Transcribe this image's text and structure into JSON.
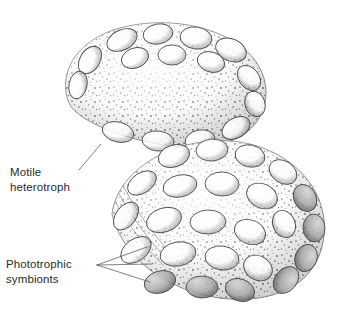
{
  "figure": {
    "background_color": "#ffffff",
    "width": 340,
    "height": 319
  },
  "labels": [
    {
      "id": "motile-heterotroph",
      "line1": "Motile",
      "line2": "heterotroph",
      "text_x": 10,
      "line1_y": 176,
      "line2_y": 191,
      "leader_paths": [
        "M 79 170 L 101 144"
      ]
    },
    {
      "id": "phototrophic-symbionts",
      "line1": "Phototrophic",
      "line2": "symbionts",
      "text_x": 6,
      "line1_y": 268,
      "line2_y": 283,
      "leader_paths": [
        "M 97 265 L 147 247",
        "M 97 265 L 152 264",
        "M 97 265 L 150 282"
      ]
    }
  ],
  "colors": {
    "body_fill": "#f4f4f4",
    "body_stroke": "#6f6f6f",
    "symbiont_fill": "#fafafa",
    "symbiont_stroke": "#4d4d4d",
    "stipple_dark": "#3f3f3f",
    "stipple_mid": "#7a7a7a",
    "text": "#2b2b2b",
    "leader": "#4a4a4a"
  },
  "organisms": [
    {
      "id": "upper-heterotroph",
      "name": "motile heterotroph (upper cell)",
      "outline": "M 66 92 C 62 62, 86 36, 124 27 C 166 17, 214 25, 243 48 C 268 68, 272 98, 258 120 C 243 143, 208 152, 170 146 C 128 140, 92 126, 76 112 C 69 106, 67 99, 66 92 Z"
    },
    {
      "id": "lower-heterotroph",
      "name": "motile heterotroph (lower cell)",
      "outline": "M 112 214 C 116 180, 150 152, 196 143 C 244 134, 290 152, 312 186 C 331 215, 328 255, 304 278 C 278 302, 231 305, 190 291 C 150 277, 121 250, 112 214 Z"
    }
  ],
  "symbionts": {
    "description": "Lens-shaped phototrophic symbiont cells embedded across the heterotroph surface",
    "upper": [
      {
        "cx": 122,
        "cy": 40,
        "rx": 16,
        "ry": 10,
        "rot": -26
      },
      {
        "cx": 158,
        "cy": 34,
        "rx": 15,
        "ry": 10,
        "rot": -10
      },
      {
        "cx": 196,
        "cy": 38,
        "rx": 16,
        "ry": 11,
        "rot": 8
      },
      {
        "cx": 231,
        "cy": 50,
        "rx": 16,
        "ry": 11,
        "rot": 24
      },
      {
        "cx": 90,
        "cy": 60,
        "rx": 15,
        "ry": 10,
        "rot": -58
      },
      {
        "cx": 78,
        "cy": 85,
        "rx": 14,
        "ry": 9,
        "rot": -78
      },
      {
        "cx": 135,
        "cy": 58,
        "rx": 14,
        "ry": 10,
        "rot": -20
      },
      {
        "cx": 172,
        "cy": 55,
        "rx": 14,
        "ry": 10,
        "rot": 0
      },
      {
        "cx": 211,
        "cy": 62,
        "rx": 14,
        "ry": 10,
        "rot": 18
      },
      {
        "cx": 249,
        "cy": 78,
        "rx": 14,
        "ry": 10,
        "rot": 52
      },
      {
        "cx": 255,
        "cy": 104,
        "rx": 13,
        "ry": 10,
        "rot": 72
      },
      {
        "cx": 118,
        "cy": 132,
        "rx": 16,
        "ry": 10,
        "rot": 14
      },
      {
        "cx": 158,
        "cy": 141,
        "rx": 16,
        "ry": 10,
        "rot": 6
      },
      {
        "cx": 200,
        "cy": 140,
        "rx": 15,
        "ry": 10,
        "rot": -10
      },
      {
        "cx": 236,
        "cy": 128,
        "rx": 15,
        "ry": 10,
        "rot": -30
      }
    ],
    "lower": [
      {
        "cx": 174,
        "cy": 156,
        "rx": 16,
        "ry": 11,
        "rot": -18
      },
      {
        "cx": 212,
        "cy": 150,
        "rx": 16,
        "ry": 11,
        "rot": -4
      },
      {
        "cx": 250,
        "cy": 156,
        "rx": 15,
        "ry": 11,
        "rot": 12
      },
      {
        "cx": 283,
        "cy": 172,
        "rx": 15,
        "ry": 11,
        "rot": 34
      },
      {
        "cx": 305,
        "cy": 198,
        "rx": 14,
        "ry": 11,
        "rot": 62
      },
      {
        "cx": 314,
        "cy": 228,
        "rx": 14,
        "ry": 11,
        "rot": 86
      },
      {
        "cx": 306,
        "cy": 258,
        "rx": 14,
        "ry": 11,
        "rot": 110
      },
      {
        "cx": 286,
        "cy": 280,
        "rx": 15,
        "ry": 11,
        "rot": 130
      },
      {
        "cx": 142,
        "cy": 183,
        "rx": 16,
        "ry": 10,
        "rot": -34
      },
      {
        "cx": 180,
        "cy": 186,
        "rx": 17,
        "ry": 11,
        "rot": -12
      },
      {
        "cx": 222,
        "cy": 184,
        "rx": 17,
        "ry": 12,
        "rot": 2
      },
      {
        "cx": 262,
        "cy": 196,
        "rx": 16,
        "ry": 12,
        "rot": 26
      },
      {
        "cx": 284,
        "cy": 224,
        "rx": 14,
        "ry": 11,
        "rot": 66
      },
      {
        "cx": 126,
        "cy": 216,
        "rx": 16,
        "ry": 10,
        "rot": -52
      },
      {
        "cx": 164,
        "cy": 220,
        "rx": 18,
        "ry": 12,
        "rot": -18
      },
      {
        "cx": 208,
        "cy": 222,
        "rx": 18,
        "ry": 12,
        "rot": -2
      },
      {
        "cx": 250,
        "cy": 232,
        "rx": 16,
        "ry": 12,
        "rot": 22
      },
      {
        "cx": 136,
        "cy": 250,
        "rx": 17,
        "ry": 11,
        "rot": -36
      },
      {
        "cx": 178,
        "cy": 254,
        "rx": 18,
        "ry": 12,
        "rot": -10
      },
      {
        "cx": 222,
        "cy": 258,
        "rx": 17,
        "ry": 12,
        "rot": 8
      },
      {
        "cx": 258,
        "cy": 268,
        "rx": 15,
        "ry": 12,
        "rot": 30
      },
      {
        "cx": 160,
        "cy": 282,
        "rx": 16,
        "ry": 11,
        "rot": -16
      },
      {
        "cx": 202,
        "cy": 287,
        "rx": 16,
        "ry": 11,
        "rot": 2
      },
      {
        "cx": 240,
        "cy": 290,
        "rx": 15,
        "ry": 11,
        "rot": 20
      }
    ]
  },
  "membrane_striations": [
    "M 118 176 C 132 204, 150 232, 172 254",
    "M 113 183 C 128 211, 146 238, 168 260",
    "M 109 191 C 124 218, 142 245, 164 266"
  ]
}
